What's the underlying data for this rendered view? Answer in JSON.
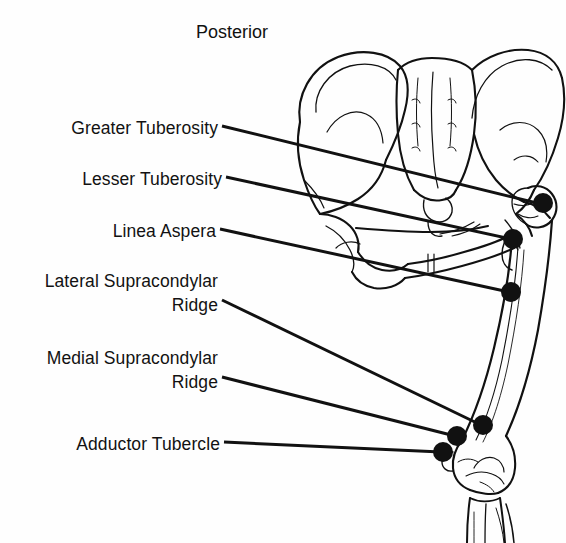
{
  "figure": {
    "title": "Posterior",
    "background_color": "#fefefe",
    "ink_color": "#111111",
    "marker_color": "#111111"
  },
  "labels": [
    {
      "id": "greater-tuberosity",
      "text": "Greater Tuberosity",
      "lines": [
        "Greater Tuberosity"
      ],
      "text_x": 218,
      "text_y": 130,
      "align": "right",
      "leader_start": [
        222,
        126
      ],
      "leader_end": [
        541,
        204
      ],
      "marker": [
        543,
        203
      ]
    },
    {
      "id": "lesser-tuberosity",
      "text": "Lesser Tuberosity",
      "lines": [
        "Lesser Tuberosity"
      ],
      "text_x": 222,
      "text_y": 181,
      "align": "right",
      "leader_start": [
        226,
        177
      ],
      "leader_end": [
        511,
        239
      ],
      "marker": [
        513,
        239
      ]
    },
    {
      "id": "linea-aspera",
      "text": "Linea Aspera",
      "lines": [
        "Linea Aspera"
      ],
      "text_x": 216,
      "text_y": 233,
      "align": "right",
      "leader_start": [
        220,
        229
      ],
      "leader_end": [
        509,
        292
      ],
      "marker": [
        511,
        292
      ]
    },
    {
      "id": "lateral-supracondylar-ridge",
      "text": "Lateral Supracondylar Ridge",
      "lines": [
        "Lateral Supracondylar",
        "Ridge"
      ],
      "text_x": 218,
      "text_y": 284,
      "align": "right",
      "leader_start": [
        222,
        300
      ],
      "leader_end": [
        481,
        425
      ],
      "marker": [
        483,
        425
      ]
    },
    {
      "id": "medial-supracondylar-ridge",
      "text": "Medial Supracondylar Ridge",
      "lines": [
        "Medial Supracondylar",
        "Ridge"
      ],
      "text_x": 218,
      "text_y": 361,
      "align": "right",
      "leader_start": [
        222,
        377
      ],
      "leader_end": [
        455,
        436
      ],
      "marker": [
        457,
        436
      ]
    },
    {
      "id": "adductor-tubercle",
      "text": "Adductor Tubercle",
      "lines": [
        "Adductor Tubercle"
      ],
      "text_x": 220,
      "text_y": 446,
      "align": "right",
      "leader_start": [
        224,
        442
      ],
      "leader_end": [
        441,
        452
      ],
      "marker": [
        443,
        452
      ]
    }
  ],
  "label_text": {
    "greater_tuberosity": "Greater Tuberosity",
    "lesser_tuberosity": "Lesser Tuberosity",
    "linea_aspera": "Linea Aspera",
    "lateral_supracondylar_line1": "Lateral Supracondylar",
    "lateral_supracondylar_line2": "Ridge",
    "medial_supracondylar_line1": "Medial Supracondylar",
    "medial_supracondylar_line2": "Ridge",
    "adductor_tubercle": "Adductor Tubercle"
  }
}
